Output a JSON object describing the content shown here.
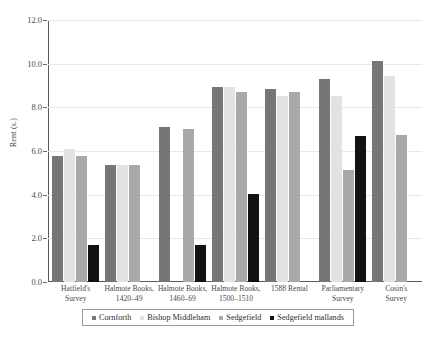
{
  "chart_data": {
    "type": "bar",
    "title": "",
    "subtitle": "",
    "xlabel": "",
    "ylabel": "Rent (s.)",
    "ylim": [
      0.0,
      12.0
    ],
    "ytick_labels": [
      "0.0",
      "2.0",
      "4.0",
      "6.0",
      "8.0",
      "10.0",
      "12.0"
    ],
    "ytick_values": [
      0.0,
      2.0,
      4.0,
      6.0,
      8.0,
      10.0,
      12.0
    ],
    "grid": true,
    "legend_position": "bottom",
    "categories": [
      "Hatfield's Survey",
      "Halmote Books, 1420–49",
      "Halmote Books, 1460–69",
      "Halmote Books, 1500–1510",
      "1588 Rental",
      "Parliamentary Survey",
      "Cosin's Survey"
    ],
    "category_lines": [
      [
        "Hatfield's",
        "Survey"
      ],
      [
        "Halmote Books,",
        "1420–49"
      ],
      [
        "Halmote Books,",
        "1460–69"
      ],
      [
        "Halmote Books,",
        "1500–1510"
      ],
      [
        "1588 Rental",
        ""
      ],
      [
        "Parliamentary",
        "Survey"
      ],
      [
        "Cosin's",
        "Survey"
      ]
    ],
    "series": [
      {
        "name": "Cornforth",
        "color": "#767676",
        "values": [
          5.75,
          5.35,
          7.1,
          8.95,
          8.85,
          9.3,
          10.1
        ]
      },
      {
        "name": "Bishop Middleham",
        "color": "#e2e2e2",
        "values": [
          6.1,
          5.35,
          null,
          8.95,
          8.5,
          8.5,
          9.45
        ]
      },
      {
        "name": "Sedgefield",
        "color": "#a9a9a9",
        "values": [
          5.75,
          5.35,
          7.0,
          8.7,
          8.7,
          5.15,
          6.75
        ]
      },
      {
        "name": "Sedgefield mallands",
        "color": "#121212",
        "values": [
          1.7,
          null,
          1.7,
          4.05,
          null,
          6.7,
          null
        ]
      }
    ]
  },
  "legend": {
    "items": [
      {
        "label": "Cornforth",
        "color": "#767676"
      },
      {
        "label": "Bishop Middleham",
        "color": "#e2e2e2"
      },
      {
        "label": "Sedgefield",
        "color": "#a9a9a9"
      },
      {
        "label": "Sedgefield mallands",
        "color": "#121212"
      }
    ]
  }
}
